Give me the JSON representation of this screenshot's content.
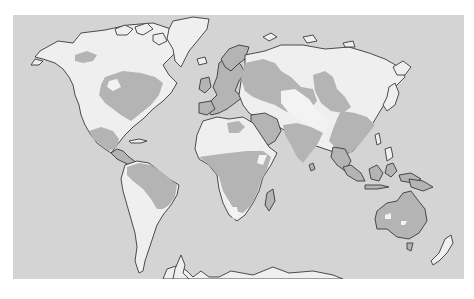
{
  "map": {
    "type": "world-thematic-map",
    "projection": "miller-like",
    "legend": [],
    "colors": {
      "ocean": "#d4d4d4",
      "land_light": "#efefef",
      "land_shaded": "#b4b4b4",
      "coastline": "#3a3a3a",
      "background": "#ffffff"
    },
    "shaded_regions": [
      "Eastern North America",
      "Central America",
      "Northern South America",
      "Europe",
      "Western Russia",
      "Central Siberia",
      "Sub-Saharan Africa",
      "South Asia",
      "East Asia",
      "Southeast Asia",
      "Australia"
    ],
    "light_regions": [
      "Alaska/Northern Canada",
      "Western North America",
      "Greenland",
      "Northern Siberia",
      "Sahara",
      "Central Asia",
      "Southern South America",
      "Southern Africa",
      "Antarctica",
      "New Zealand"
    ]
  }
}
